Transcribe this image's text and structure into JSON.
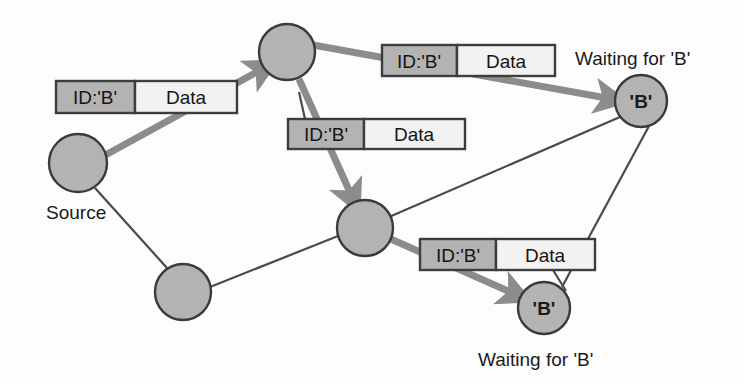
{
  "diagram": {
    "colors": {
      "node_fill": "#b3b3b3",
      "node_stroke": "#3a3a3a",
      "packet_id_fill": "#b3b3b3",
      "packet_data_fill": "#f2f2f2",
      "packet_stroke": "#3d3d3d",
      "thick_edge": "#8c8c8c",
      "thin_edge": "#4a4a4a",
      "text": "#1a1a1a",
      "background": "#fdfdfd"
    },
    "nodes": [
      {
        "id": "source",
        "label": "",
        "caption": "Source",
        "caption_position": "below-left",
        "cx": 78,
        "cy": 163,
        "r": 29
      },
      {
        "id": "relay-top",
        "label": "",
        "caption": "",
        "caption_position": "none",
        "cx": 287,
        "cy": 52,
        "r": 28
      },
      {
        "id": "relay-bottom-left",
        "label": "",
        "caption": "",
        "caption_position": "none",
        "cx": 183,
        "cy": 292,
        "r": 28
      },
      {
        "id": "relay-mid",
        "label": "",
        "caption": "",
        "caption_position": "none",
        "cx": 365,
        "cy": 228,
        "r": 28
      },
      {
        "id": "dest-upper",
        "label": "'B'",
        "caption": "Waiting for 'B'",
        "caption_position": "above",
        "cx": 641,
        "cy": 101,
        "r": 26
      },
      {
        "id": "dest-lower",
        "label": "'B'",
        "caption": "Waiting for 'B'",
        "caption_position": "below",
        "cx": 544,
        "cy": 308,
        "r": 26
      }
    ],
    "packets": [
      {
        "id": "packet-1",
        "id_label": "ID:'B'",
        "data_label": "Data",
        "x": 56,
        "y": 81,
        "width": 181,
        "height": 32,
        "split": 79
      },
      {
        "id": "packet-2",
        "id_label": "ID:'B'",
        "data_label": "Data",
        "x": 288,
        "y": 119,
        "width": 177,
        "height": 30,
        "split": 76
      },
      {
        "id": "packet-3",
        "id_label": "ID:'B'",
        "data_label": "Data",
        "x": 382,
        "y": 45,
        "width": 173,
        "height": 31,
        "split": 75
      },
      {
        "id": "packet-4",
        "id_label": "ID:'B'",
        "data_label": "Data",
        "x": 420,
        "y": 239,
        "width": 175,
        "height": 31,
        "split": 76
      }
    ],
    "thick_arrows": [
      {
        "id": "arrow-source-to-relay-top",
        "from": "source",
        "to": "relay-top"
      },
      {
        "id": "arrow-relay-top-to-dest-upper",
        "from": "relay-top",
        "to": "dest-upper"
      },
      {
        "id": "arrow-relay-top-to-relay-mid",
        "from": "relay-top",
        "to": "relay-mid"
      },
      {
        "id": "arrow-relay-mid-to-dest-lower",
        "from": "relay-mid",
        "to": "dest-lower"
      }
    ],
    "thin_links": [
      {
        "id": "link-source-to-relay-bottom-left",
        "from": "source",
        "to": "relay-bottom-left"
      },
      {
        "id": "link-relay-bottom-left-to-relay-mid",
        "from": "relay-bottom-left",
        "to": "relay-mid"
      },
      {
        "id": "link-relay-mid-to-dest-upper",
        "from": "relay-mid",
        "to": "dest-upper"
      },
      {
        "id": "link-dest-upper-to-dest-lower",
        "from": "dest-upper",
        "to": "dest-lower"
      }
    ],
    "captions": {
      "source": "Source",
      "waiting_upper": "Waiting for 'B'",
      "waiting_lower": "Waiting for 'B'"
    },
    "packet_labels": {
      "id": "ID:'B'",
      "data": "Data"
    }
  }
}
